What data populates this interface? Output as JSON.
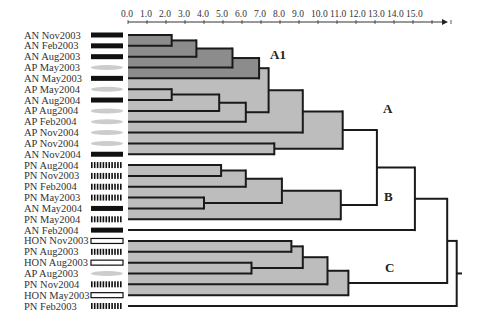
{
  "chart_data": {
    "type": "dendrogram",
    "title": "",
    "xlabel": "",
    "axis": {
      "min": 0,
      "max": 15,
      "ticks": [
        "0.0",
        "1.0",
        "2.0",
        "3.0",
        "4.0",
        "5.0",
        "6.0",
        "7.0",
        "8.0",
        "9.0",
        "10.0",
        "11.0",
        "12.0",
        "13.0",
        "14.0",
        "15.0"
      ],
      "arrow": true
    },
    "legend_symbols": {
      "AN": "solid-black-bar",
      "AP": "grey-ellipse",
      "PN": "hatched-bar",
      "HON": "open-rectangle"
    },
    "leaves": [
      {
        "label": "AN Nov2003",
        "group": "AN"
      },
      {
        "label": "AN Feb2003",
        "group": "AN"
      },
      {
        "label": "AN Aug2003",
        "group": "AN"
      },
      {
        "label": "AP May2003",
        "group": "AP"
      },
      {
        "label": "AN May2003",
        "group": "AN"
      },
      {
        "label": "AP May2004",
        "group": "AP"
      },
      {
        "label": "AN Aug2004",
        "group": "AN"
      },
      {
        "label": "AP Aug2004",
        "group": "AP"
      },
      {
        "label": "AP Feb2004",
        "group": "AP"
      },
      {
        "label": "AP Nov2004",
        "group": "AP"
      },
      {
        "label": "AP Nov2004",
        "group": "AP"
      },
      {
        "label": "AN Nov2004",
        "group": "AN"
      },
      {
        "label": "PN Aug2004",
        "group": "PN"
      },
      {
        "label": "PN Nov2003",
        "group": "PN"
      },
      {
        "label": "PN Feb2004",
        "group": "PN"
      },
      {
        "label": "PN May2003",
        "group": "PN"
      },
      {
        "label": "AN May2004",
        "group": "AN"
      },
      {
        "label": "PN May2004",
        "group": "PN"
      },
      {
        "label": "AN Feb2004",
        "group": "AN"
      },
      {
        "label": "HON Nov2003",
        "group": "HON"
      },
      {
        "label": "PN Aug2003",
        "group": "PN"
      },
      {
        "label": "HON Aug2003",
        "group": "HON"
      },
      {
        "label": "AP Aug2003",
        "group": "AP"
      },
      {
        "label": "PN Nov2004",
        "group": "PN"
      },
      {
        "label": "HON May2003",
        "group": "HON"
      },
      {
        "label": "PN Feb2003",
        "group": "PN"
      }
    ],
    "merges": [
      {
        "id": "m1",
        "a": "L0",
        "b": "L1",
        "h": 2.3,
        "fill": "dark"
      },
      {
        "id": "m2",
        "a": "m1",
        "b": "L2",
        "h": 3.6,
        "fill": "dark"
      },
      {
        "id": "m3",
        "a": "m2",
        "b": "L3",
        "h": 5.5,
        "fill": "dark"
      },
      {
        "id": "m4",
        "a": "m3",
        "b": "L4",
        "h": 6.9,
        "fill": "dark"
      },
      {
        "id": "m5",
        "a": "L5",
        "b": "L6",
        "h": 2.3,
        "fill": "light"
      },
      {
        "id": "m6",
        "a": "m5",
        "b": "L7",
        "h": 4.8,
        "fill": "light"
      },
      {
        "id": "m7",
        "a": "m6",
        "b": "L8",
        "h": 6.2,
        "fill": "light"
      },
      {
        "id": "m8",
        "a": "m4",
        "b": "m7",
        "h": 7.4,
        "fill": "light"
      },
      {
        "id": "m9",
        "a": "m8",
        "b": "L9",
        "h": 9.2,
        "fill": "light"
      },
      {
        "id": "m10",
        "a": "L10",
        "b": "L11",
        "h": 7.7,
        "fill": "light"
      },
      {
        "id": "m11",
        "a": "m9",
        "b": "m10",
        "h": 11.3,
        "fill": "light"
      },
      {
        "id": "m12",
        "a": "L12",
        "b": "L13",
        "h": 4.9,
        "fill": "light"
      },
      {
        "id": "m13",
        "a": "m12",
        "b": "L14",
        "h": 6.2,
        "fill": "light"
      },
      {
        "id": "m14",
        "a": "L15",
        "b": "L16",
        "h": 4.0,
        "fill": "light"
      },
      {
        "id": "m15",
        "a": "m13",
        "b": "m14",
        "h": 8.1,
        "fill": "light"
      },
      {
        "id": "m16",
        "a": "m15",
        "b": "L17",
        "h": 11.2,
        "fill": "light"
      },
      {
        "id": "m17",
        "a": "m11",
        "b": "m16",
        "h": 13.1,
        "fill": "none"
      },
      {
        "id": "m18",
        "a": "m17",
        "b": "L18",
        "h": 15.1,
        "fill": "none"
      },
      {
        "id": "m19",
        "a": "L19",
        "b": "L20",
        "h": 8.6,
        "fill": "light"
      },
      {
        "id": "m20",
        "a": "L21",
        "b": "L22",
        "h": 6.5,
        "fill": "light"
      },
      {
        "id": "m21",
        "a": "m19",
        "b": "m20",
        "h": 9.2,
        "fill": "light"
      },
      {
        "id": "m22",
        "a": "m21",
        "b": "L23",
        "h": 10.5,
        "fill": "light"
      },
      {
        "id": "m23",
        "a": "m22",
        "b": "L24",
        "h": 11.6,
        "fill": "light"
      },
      {
        "id": "m24",
        "a": "m18",
        "b": "m23",
        "h": 16.8,
        "fill": "none"
      },
      {
        "id": "m25",
        "a": "m24",
        "b": "L25",
        "h": 17.3,
        "fill": "none"
      }
    ],
    "cluster_labels": [
      {
        "text": "A1",
        "x": 270,
        "y": 59,
        "bold": true
      },
      {
        "text": "A",
        "x": 383,
        "y": 113,
        "bold": true
      },
      {
        "text": "B",
        "x": 384,
        "y": 201,
        "bold": true
      },
      {
        "text": "C",
        "x": 385,
        "y": 272,
        "bold": true
      }
    ],
    "root_stub_to": 462,
    "colors": {
      "line": "#1a1a1a",
      "dark_fill": "#8c8c8c",
      "light_fill": "#bdbdbd",
      "text": "#333333",
      "ellipse": "#cccccc"
    }
  }
}
